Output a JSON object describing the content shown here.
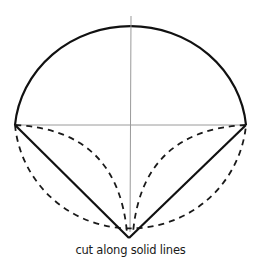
{
  "caption": "cut along solid lines",
  "colors": {
    "solid_line": "#111111",
    "dashed_line": "#1a1a1a",
    "guide_line": "#9a9a9a",
    "background": "#ffffff"
  },
  "geometry": {
    "center": [
      131,
      125
    ],
    "radius_x": 115,
    "radius_y_top": 109,
    "radius_y_bottom": 114,
    "left_point": [
      15,
      125
    ],
    "right_point": [
      246,
      125
    ],
    "bottom_point": [
      129,
      239
    ],
    "top_point": [
      131,
      16
    ]
  },
  "elements": {
    "upper_semicircle": "solid",
    "lower_semicircle": "dashed",
    "diameter": "thin guide",
    "vertical_radius": "thin guide",
    "left_chord": "solid",
    "right_chord": "solid",
    "left_inner_arc": "dashed",
    "right_inner_arc": "dashed",
    "left_top_dashed": "dashed",
    "right_top_dashed": "dashed"
  }
}
